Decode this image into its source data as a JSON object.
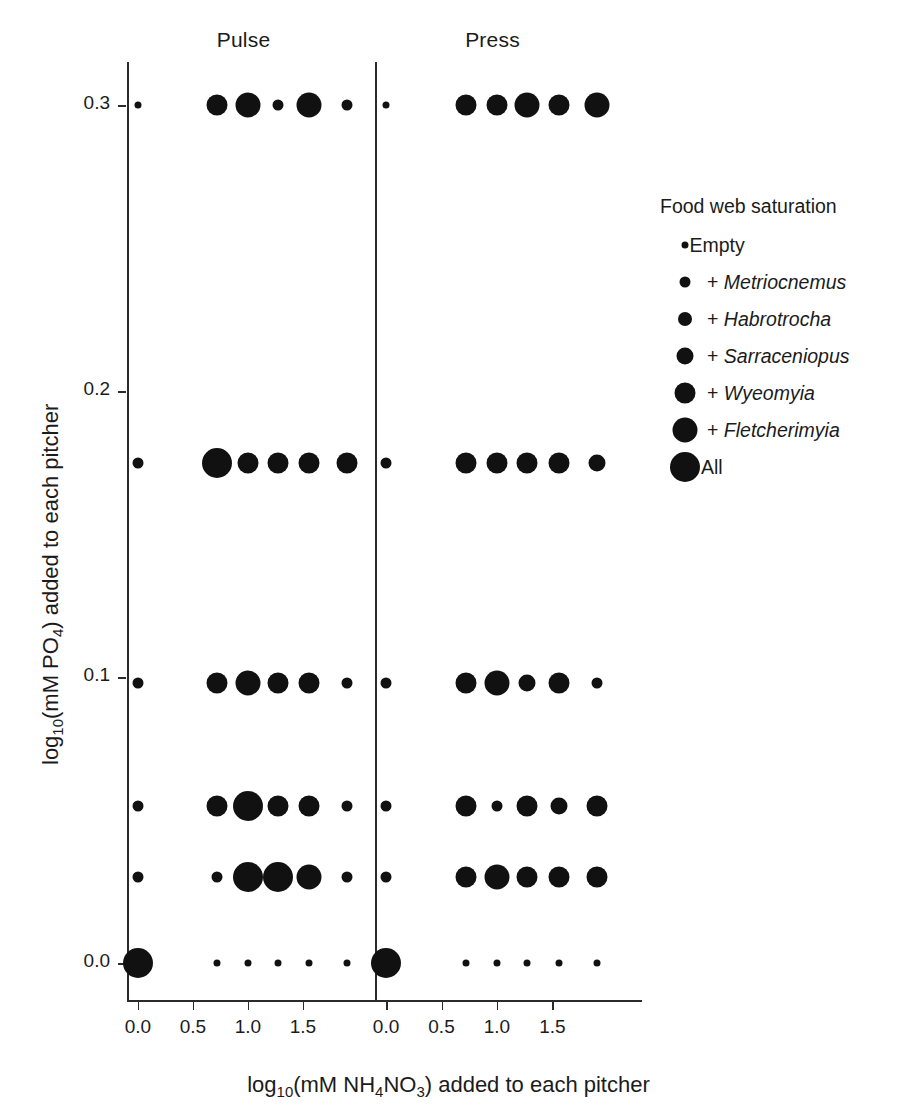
{
  "figure": {
    "axis_title_x_parts": {
      "pre": "log",
      "sub1": "10",
      "mid": "(mM NH",
      "sub2": "4",
      "mid2": "NO",
      "sub3": "3",
      "post": ") added to each pitcher"
    },
    "axis_title_x": "log10(mM NH4NO3) added to each pitcher",
    "axis_title_y": "log10(mM PO4) added to each pitcher",
    "axis_title_y_parts": {
      "pre": "log",
      "sub1": "10",
      "mid": "(mM PO",
      "sub2": "4",
      "post": ") added to each pitcher"
    },
    "panels": [
      {
        "name": "pulse",
        "title": "Pulse"
      },
      {
        "name": "press",
        "title": "Press"
      }
    ],
    "x_ticks": [
      "0.0",
      "0.5",
      "1.0",
      "1.5"
    ],
    "x_tick_values": [
      0.0,
      0.5,
      1.0,
      1.5
    ],
    "y_ticks": [
      "0.0",
      "0.1",
      "0.2",
      "0.3"
    ],
    "y_tick_values": [
      0.0,
      0.1,
      0.2,
      0.3
    ]
  },
  "legend": {
    "title": "Food web saturation",
    "items": [
      {
        "label": "Empty",
        "species": "",
        "level": 0,
        "size": 7
      },
      {
        "label": "+ Metriocnemus",
        "prefix": "+ ",
        "species": "Metriocnemus",
        "level": 1,
        "size": 11
      },
      {
        "label": "+ Habrotrocha",
        "prefix": "+ ",
        "species": "Habrotrocha",
        "level": 2,
        "size": 14
      },
      {
        "label": "+ Sarraceniopus",
        "prefix": "+ ",
        "species": "Sarraceniopus",
        "level": 3,
        "size": 17
      },
      {
        "label": "+ Wyeomyia",
        "prefix": "+ ",
        "species": "Wyeomyia",
        "level": 4,
        "size": 21
      },
      {
        "label": "+ Fletcherimyia",
        "prefix": "+ ",
        "species": "Fletcherimyia",
        "level": 5,
        "size": 25
      },
      {
        "label": "All",
        "prefix": "",
        "species": "",
        "level": 6,
        "size": 30
      }
    ]
  },
  "chart_data": {
    "type": "scatter",
    "title": "",
    "xlabel": "log10(mM NH4NO3) added to each pitcher",
    "ylabel": "log10(mM PO4) added to each pitcher",
    "xlim": [
      -0.12,
      2.05
    ],
    "ylim": [
      -0.012,
      0.318
    ],
    "grid": false,
    "legend_position": "right",
    "size_encodes": "Food web saturation (0 = Empty ... 6 = All)",
    "size_scale_px": [
      7,
      11,
      14,
      17,
      21,
      25,
      30
    ],
    "x_values": [
      0.0,
      0.72,
      1.0,
      1.27,
      1.56,
      1.9
    ],
    "y_values": [
      0.0,
      0.03,
      0.055,
      0.098,
      0.175,
      0.3
    ],
    "panels": [
      {
        "name": "Pulse",
        "points": [
          {
            "x": 0.0,
            "y": 0.3,
            "size_level": 0
          },
          {
            "x": 0.72,
            "y": 0.3,
            "size_level": 4
          },
          {
            "x": 1.0,
            "y": 0.3,
            "size_level": 5
          },
          {
            "x": 1.27,
            "y": 0.3,
            "size_level": 1
          },
          {
            "x": 1.56,
            "y": 0.3,
            "size_level": 5
          },
          {
            "x": 1.9,
            "y": 0.3,
            "size_level": 1
          },
          {
            "x": 0.0,
            "y": 0.175,
            "size_level": 1
          },
          {
            "x": 0.72,
            "y": 0.175,
            "size_level": 6
          },
          {
            "x": 1.0,
            "y": 0.175,
            "size_level": 4
          },
          {
            "x": 1.27,
            "y": 0.175,
            "size_level": 4
          },
          {
            "x": 1.56,
            "y": 0.175,
            "size_level": 4
          },
          {
            "x": 1.9,
            "y": 0.175,
            "size_level": 4
          },
          {
            "x": 0.0,
            "y": 0.098,
            "size_level": 1
          },
          {
            "x": 0.72,
            "y": 0.098,
            "size_level": 4
          },
          {
            "x": 1.0,
            "y": 0.098,
            "size_level": 5
          },
          {
            "x": 1.27,
            "y": 0.098,
            "size_level": 4
          },
          {
            "x": 1.56,
            "y": 0.098,
            "size_level": 4
          },
          {
            "x": 1.9,
            "y": 0.098,
            "size_level": 1
          },
          {
            "x": 0.0,
            "y": 0.055,
            "size_level": 1
          },
          {
            "x": 0.72,
            "y": 0.055,
            "size_level": 4
          },
          {
            "x": 1.0,
            "y": 0.055,
            "size_level": 6
          },
          {
            "x": 1.27,
            "y": 0.055,
            "size_level": 4
          },
          {
            "x": 1.56,
            "y": 0.055,
            "size_level": 4
          },
          {
            "x": 1.9,
            "y": 0.055,
            "size_level": 1
          },
          {
            "x": 0.0,
            "y": 0.03,
            "size_level": 1
          },
          {
            "x": 0.72,
            "y": 0.03,
            "size_level": 1
          },
          {
            "x": 1.0,
            "y": 0.03,
            "size_level": 6
          },
          {
            "x": 1.27,
            "y": 0.03,
            "size_level": 6
          },
          {
            "x": 1.56,
            "y": 0.03,
            "size_level": 5
          },
          {
            "x": 1.9,
            "y": 0.03,
            "size_level": 1
          },
          {
            "x": 0.0,
            "y": 0.0,
            "size_level": 6
          },
          {
            "x": 0.72,
            "y": 0.0,
            "size_level": 0
          },
          {
            "x": 1.0,
            "y": 0.0,
            "size_level": 0
          },
          {
            "x": 1.27,
            "y": 0.0,
            "size_level": 0
          },
          {
            "x": 1.56,
            "y": 0.0,
            "size_level": 0
          },
          {
            "x": 1.9,
            "y": 0.0,
            "size_level": 0
          }
        ]
      },
      {
        "name": "Press",
        "points": [
          {
            "x": 0.0,
            "y": 0.3,
            "size_level": 0
          },
          {
            "x": 0.72,
            "y": 0.3,
            "size_level": 4
          },
          {
            "x": 1.0,
            "y": 0.3,
            "size_level": 4
          },
          {
            "x": 1.27,
            "y": 0.3,
            "size_level": 5
          },
          {
            "x": 1.56,
            "y": 0.3,
            "size_level": 4
          },
          {
            "x": 1.9,
            "y": 0.3,
            "size_level": 5
          },
          {
            "x": 0.0,
            "y": 0.175,
            "size_level": 1
          },
          {
            "x": 0.72,
            "y": 0.175,
            "size_level": 4
          },
          {
            "x": 1.0,
            "y": 0.175,
            "size_level": 4
          },
          {
            "x": 1.27,
            "y": 0.175,
            "size_level": 4
          },
          {
            "x": 1.56,
            "y": 0.175,
            "size_level": 4
          },
          {
            "x": 1.9,
            "y": 0.175,
            "size_level": 3
          },
          {
            "x": 0.0,
            "y": 0.098,
            "size_level": 1
          },
          {
            "x": 0.72,
            "y": 0.098,
            "size_level": 4
          },
          {
            "x": 1.0,
            "y": 0.098,
            "size_level": 5
          },
          {
            "x": 1.27,
            "y": 0.098,
            "size_level": 3
          },
          {
            "x": 1.56,
            "y": 0.098,
            "size_level": 4
          },
          {
            "x": 1.9,
            "y": 0.098,
            "size_level": 1
          },
          {
            "x": 0.0,
            "y": 0.055,
            "size_level": 1
          },
          {
            "x": 0.72,
            "y": 0.055,
            "size_level": 4
          },
          {
            "x": 1.0,
            "y": 0.055,
            "size_level": 1
          },
          {
            "x": 1.27,
            "y": 0.055,
            "size_level": 4
          },
          {
            "x": 1.56,
            "y": 0.055,
            "size_level": 3
          },
          {
            "x": 1.9,
            "y": 0.055,
            "size_level": 4
          },
          {
            "x": 0.0,
            "y": 0.03,
            "size_level": 1
          },
          {
            "x": 0.72,
            "y": 0.03,
            "size_level": 4
          },
          {
            "x": 1.0,
            "y": 0.03,
            "size_level": 5
          },
          {
            "x": 1.27,
            "y": 0.03,
            "size_level": 4
          },
          {
            "x": 1.56,
            "y": 0.03,
            "size_level": 4
          },
          {
            "x": 1.9,
            "y": 0.03,
            "size_level": 4
          },
          {
            "x": 0.0,
            "y": 0.0,
            "size_level": 6
          },
          {
            "x": 0.72,
            "y": 0.0,
            "size_level": 0
          },
          {
            "x": 1.0,
            "y": 0.0,
            "size_level": 0
          },
          {
            "x": 1.27,
            "y": 0.0,
            "size_level": 0
          },
          {
            "x": 1.56,
            "y": 0.0,
            "size_level": 0
          },
          {
            "x": 1.9,
            "y": 0.0,
            "size_level": 0
          }
        ]
      }
    ]
  }
}
